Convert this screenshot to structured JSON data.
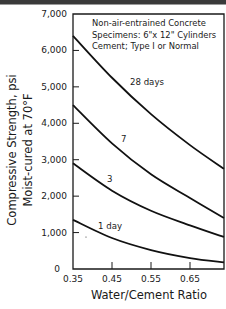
{
  "chart_data": {
    "type": "line",
    "title": "",
    "annotations": [
      "Non-air-entrained Concrete",
      "Specimens: 6\"x 12\" Cylinders",
      "Cement; Type I or Normal"
    ],
    "xlabel": "Water/Cement Ratio",
    "ylabel": "Compressive Strength, psi",
    "ylabel2": "Moist-cured at 70°F",
    "xlim": [
      0.35,
      0.74
    ],
    "ylim": [
      0,
      7000
    ],
    "grid": false,
    "x_ticks": [
      "0.35",
      "0.45",
      "0.55",
      "0.65"
    ],
    "y_ticks": [
      "0",
      "1,000",
      "2,000",
      "3,000",
      "4,000",
      "5,000",
      "6,000",
      "7,000"
    ],
    "x": [
      0.35,
      0.45,
      0.55,
      0.65,
      0.74
    ],
    "series": [
      {
        "name": "28 days",
        "label": "28 days",
        "values": [
          6400,
          5250,
          4250,
          3400,
          2750
        ]
      },
      {
        "name": "7 days",
        "label": "7",
        "values": [
          4500,
          3450,
          2600,
          1950,
          1400
        ]
      },
      {
        "name": "3 days",
        "label": "3",
        "values": [
          2900,
          2150,
          1600,
          1200,
          880
        ]
      },
      {
        "name": "1 day",
        "label": "1 day",
        "values": [
          1350,
          850,
          520,
          300,
          180
        ]
      }
    ]
  }
}
